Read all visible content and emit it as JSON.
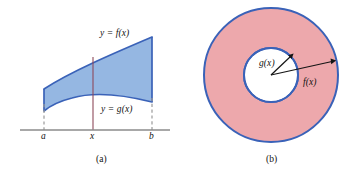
{
  "figure": {
    "width": 348,
    "height": 173,
    "background": "#ffffff",
    "panels": [
      {
        "id": "a",
        "caption": "(a)",
        "caption_x": 96,
        "caption_y": 155,
        "type": "region-between-two-curves",
        "region_fill": "#8cb1e0",
        "curve_stroke": "#3a62b8",
        "axis_stroke": "#8b8b8b",
        "dash_stroke": "#9a9a9a",
        "representative_line_stroke": "#8e4a5a",
        "labels": {
          "upper_curve": "y = f(x)",
          "upper_curve_x": 100,
          "upper_curve_y": 29,
          "lower_curve": "y = g(x)",
          "lower_curve_x": 101,
          "lower_curve_y": 105,
          "tick_a": "a",
          "tick_a_x": 41,
          "tick_x": "x",
          "tick_x_x": 90,
          "tick_b": "b",
          "tick_b_x": 149,
          "tick_label_y": 132
        },
        "geometry": {
          "axis_y": 130,
          "axis_x_start": 20,
          "axis_x_end": 170,
          "a_x": 44,
          "x_x": 93,
          "b_x": 152,
          "f_at_a_y": 89,
          "f_at_b_y": 37,
          "g_at_a_y": 111,
          "g_at_b_y": 102,
          "dash_top_a": 104,
          "dash_top_b": 98
        }
      },
      {
        "id": "b",
        "caption": "(b)",
        "caption_x": 266,
        "caption_y": 155,
        "type": "annulus-washer",
        "annulus_fill": "#eda8ac",
        "annulus_stroke": "#3a62b8",
        "inner_fill": "#ffffff",
        "arrow_stroke": "#141414",
        "labels": {
          "inner_radius": "g(x)",
          "inner_radius_x": 259,
          "inner_radius_y": 64,
          "outer_radius": "f(x)",
          "outer_radius_x": 303,
          "outer_radius_y": 83
        },
        "geometry": {
          "center_x": 271,
          "center_y": 75,
          "outer_radius": 67,
          "inner_radius": 27,
          "g_arrow_angle_deg": -42,
          "f_arrow_angle_deg": -12
        }
      }
    ]
  }
}
